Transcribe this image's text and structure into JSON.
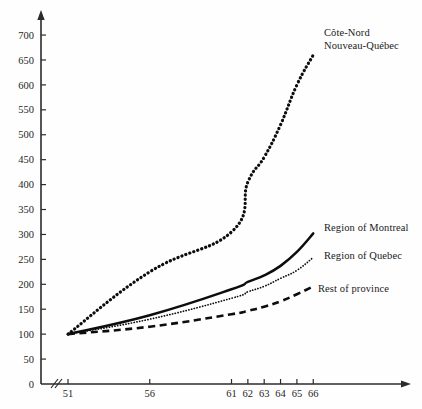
{
  "chart_data": {
    "type": "line",
    "title": "",
    "subtitle": "",
    "xlabel": "",
    "ylabel": "",
    "xlim": [
      50,
      68
    ],
    "ylim": [
      0,
      720
    ],
    "grid": false,
    "legend_position": "at-line-ends",
    "axis_break": true,
    "index_base": "1951 = 100",
    "x": [
      51,
      56,
      61,
      62,
      63,
      64,
      65,
      66
    ],
    "xtick_labels": [
      "51",
      "56",
      "61",
      "62",
      "63",
      "64",
      "65",
      "66"
    ],
    "ytick_labels": [
      "0",
      "50",
      "100",
      "150",
      "200",
      "250",
      "300",
      "350",
      "400",
      "450",
      "500",
      "550",
      "600",
      "650",
      "700"
    ],
    "ytick_values": [
      0,
      50,
      100,
      150,
      200,
      250,
      300,
      350,
      400,
      450,
      500,
      550,
      600,
      650,
      700
    ],
    "series": [
      {
        "name": "Côte-Nord Nouveau-Québec",
        "label_lines": [
          "Côte-Nord",
          "Nouveau-Québec"
        ],
        "style": "dotted-heavy",
        "color": "#0d0d0d",
        "values": [
          100,
          225,
          305,
          405,
          455,
          520,
          600,
          660
        ]
      },
      {
        "name": "Region of Montreal",
        "label_lines": [
          "Region of Montreal"
        ],
        "style": "solid",
        "color": "#0d0d0d",
        "values": [
          100,
          138,
          190,
          205,
          218,
          237,
          265,
          302
        ]
      },
      {
        "name": "Region of Quebec",
        "label_lines": [
          "Region of Quebec"
        ],
        "style": "dotted-fine",
        "color": "#0d0d0d",
        "values": [
          100,
          130,
          172,
          185,
          196,
          212,
          228,
          254
        ]
      },
      {
        "name": "Rest of province",
        "label_lines": [
          "Rest of province"
        ],
        "style": "dashed",
        "color": "#0d0d0d",
        "values": [
          100,
          115,
          140,
          147,
          155,
          166,
          180,
          196
        ]
      }
    ]
  },
  "axes": {
    "origin_label": "0",
    "break_symbol": "//"
  }
}
